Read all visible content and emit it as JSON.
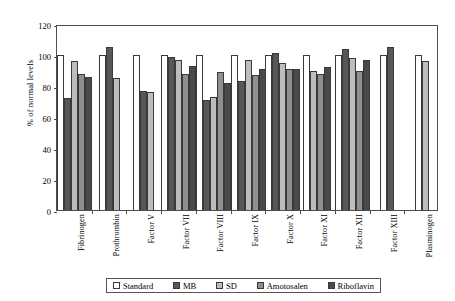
{
  "chart_data": {
    "type": "bar",
    "title": "",
    "xlabel": "",
    "ylabel": "% of normal levels",
    "ylim": [
      0,
      120
    ],
    "yticks": [
      0,
      20,
      40,
      60,
      80,
      100,
      120
    ],
    "grid": false,
    "legend_position": "bottom",
    "categories": [
      "Fibrinogen",
      "Prothrombin",
      "Factor V",
      "Factor VII",
      "Factor VIII",
      "Factor IX",
      "Factor X",
      "Factor XI",
      "Factor XII",
      "Factor XIII",
      "Plasminogen"
    ],
    "series": [
      {
        "name": "Standard",
        "color": "#ffffff",
        "values": [
          100,
          100,
          100,
          100,
          100,
          100,
          100,
          100,
          100,
          100,
          100
        ]
      },
      {
        "name": "MB",
        "color": "#575757",
        "values": [
          72,
          105,
          77,
          99,
          71,
          83,
          101,
          null,
          104,
          105,
          null
        ]
      },
      {
        "name": "SD",
        "color": "#bdbdbd",
        "values": [
          96,
          85,
          76,
          97,
          73,
          97,
          95,
          90,
          98,
          null,
          96
        ]
      },
      {
        "name": "Amotosalen",
        "color": "#8f8f8f",
        "values": [
          88,
          null,
          null,
          88,
          89,
          87,
          91,
          88,
          90,
          null,
          null
        ]
      },
      {
        "name": "Riboflavin",
        "color": "#4a4a4a",
        "values": [
          86,
          null,
          null,
          93,
          82,
          91,
          91,
          92,
          97,
          null,
          null
        ]
      }
    ]
  },
  "legend": {
    "items": [
      {
        "label": "Standard"
      },
      {
        "label": "MB"
      },
      {
        "label": "SD"
      },
      {
        "label": "Amotosalen"
      },
      {
        "label": "Riboflavin"
      }
    ]
  }
}
